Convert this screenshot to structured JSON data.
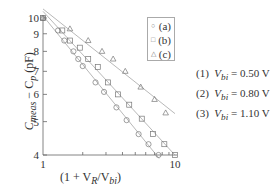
{
  "chart_data": {
    "type": "scatter",
    "title": "",
    "xlabel": "(1 + V_R/V_bi)",
    "ylabel": "C_meas − C_p (pF)",
    "xscale": "log",
    "yscale": "log",
    "xlim": [
      1,
      10
    ],
    "ylim": [
      4,
      10
    ],
    "x_ticks": [
      "1",
      "10"
    ],
    "y_ticks": [
      "4",
      "5",
      "6",
      "7",
      "8",
      "9",
      "10"
    ],
    "grid": false,
    "legend_position": "upper right inside plot",
    "series": [
      {
        "name": "(a)",
        "marker": "circle",
        "x": [
          1.0,
          1.3,
          1.45,
          1.7,
          1.85,
          2.0,
          2.5,
          2.9,
          3.6,
          4.3,
          5.3,
          6.3,
          7.5
        ],
        "y": [
          10.0,
          9.2,
          8.6,
          8.0,
          7.6,
          7.25,
          6.5,
          6.1,
          5.5,
          5.05,
          4.6,
          4.3,
          4.0
        ]
      },
      {
        "name": "(b)",
        "marker": "square",
        "x": [
          1.0,
          1.4,
          1.6,
          1.9,
          2.2,
          2.6,
          3.1,
          3.7,
          4.5,
          5.6,
          6.8,
          8.3,
          10.0
        ],
        "y": [
          10.0,
          9.2,
          8.6,
          8.2,
          7.6,
          7.2,
          6.5,
          6.0,
          5.6,
          5.1,
          4.6,
          4.3,
          4.0
        ]
      },
      {
        "name": "(c)",
        "marker": "triangle",
        "x": [
          1.0,
          1.6,
          2.2,
          2.8,
          3.4,
          4.2,
          5.5,
          7.0,
          8.5
        ],
        "y": [
          10.0,
          9.3,
          8.6,
          8.0,
          7.6,
          7.0,
          6.3,
          5.8,
          5.3
        ]
      }
    ],
    "annotations": [
      "(1)  V_bi = 0.50 V",
      "(2)  V_bi = 0.80 V",
      "(3)  V_bi = 1.10 V"
    ]
  },
  "legend": [
    {
      "symbol": "○",
      "label": "(a)"
    },
    {
      "symbol": "□",
      "label": "(b)"
    },
    {
      "symbol": "△",
      "label": "(c)"
    }
  ],
  "notes": [
    {
      "num": "(1)",
      "var": "V",
      "sub": "bi",
      "value": "= 0.50 V"
    },
    {
      "num": "(2)",
      "var": "V",
      "sub": "bi",
      "value": "= 0.80 V"
    },
    {
      "num": "(3)",
      "var": "V",
      "sub": "bi",
      "value": "= 1.10 V"
    }
  ],
  "axis": {
    "x_min_label": "1",
    "x_max_label": "10",
    "y_labels": [
      "10",
      "9",
      "8",
      "7",
      "6",
      "5",
      "4"
    ]
  },
  "labels": {
    "y_main": "C",
    "y_sub1": "meas",
    "y_mid": " − C",
    "y_sub2": "p",
    "y_unit": " (pF)",
    "x_pre": "(1 + V",
    "x_sub1": "R",
    "x_mid": "/V",
    "x_sub2": "bi",
    "x_post": ")"
  }
}
